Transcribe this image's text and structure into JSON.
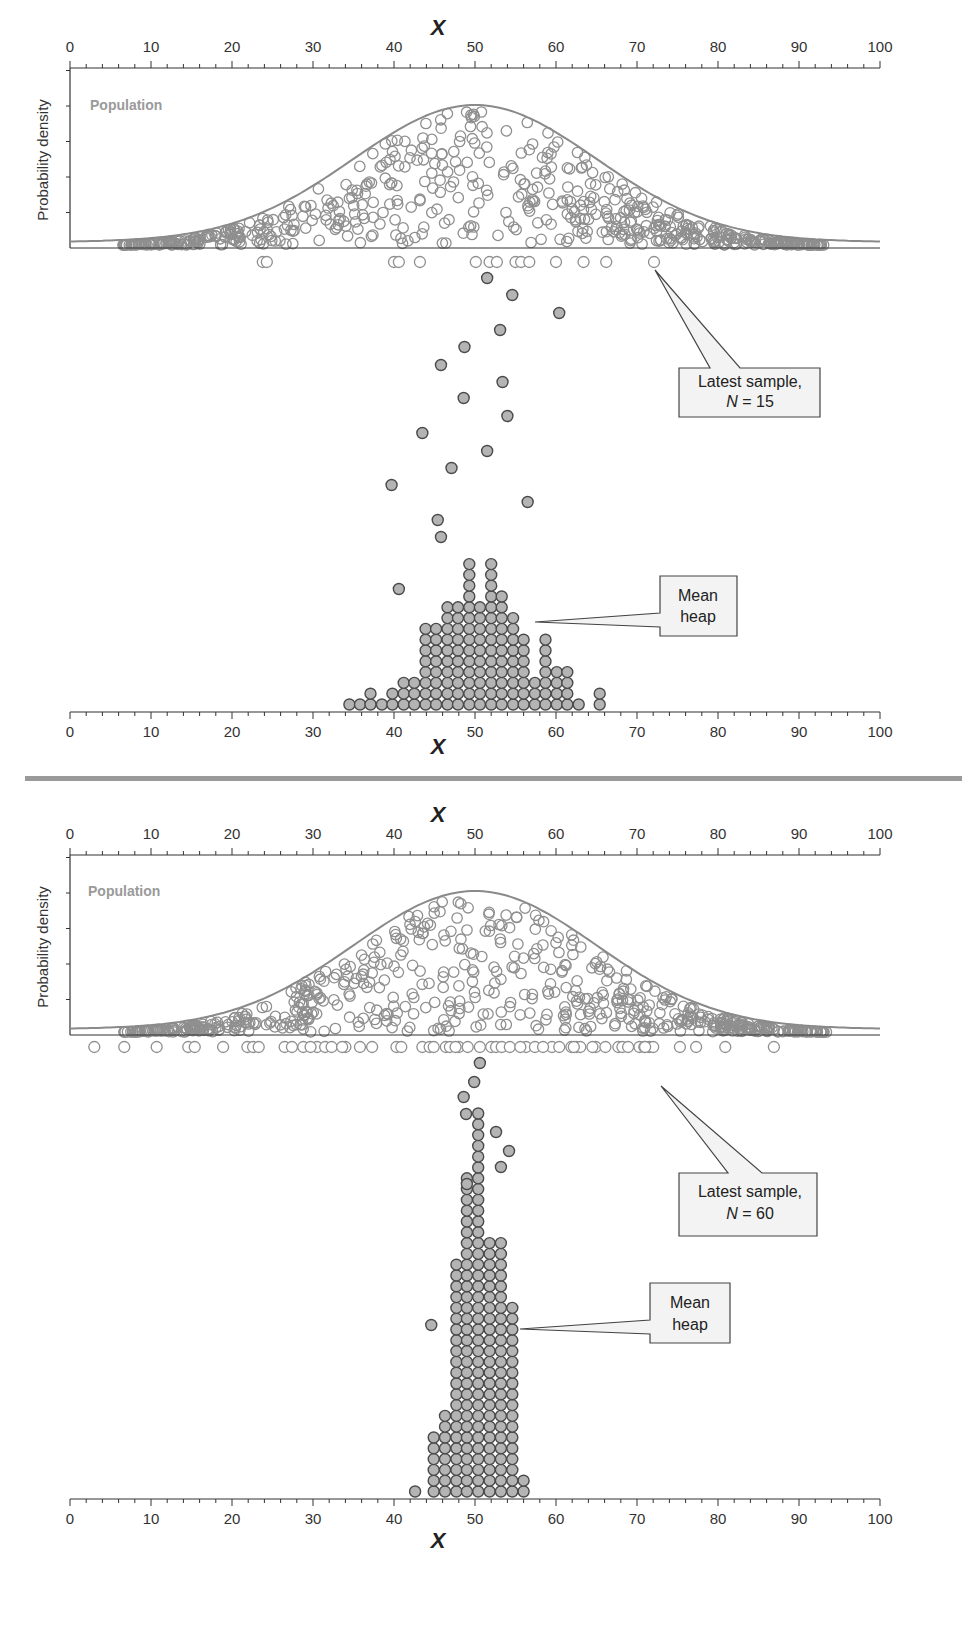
{
  "chart_data": [
    {
      "type": "scatter",
      "title": "Dance of the means: population, latest sample and mean heap",
      "xlabel": "X",
      "ylabel": "Probability density",
      "xlim": [
        0,
        100
      ],
      "x_ticks": [
        0,
        10,
        20,
        30,
        40,
        50,
        60,
        70,
        80,
        90,
        100
      ],
      "population": {
        "label": "Population",
        "distribution": "normal",
        "mean": 50,
        "sd": 15
      },
      "latest_sample": {
        "N": 15,
        "callout": [
          "Latest sample,",
          "N = 15"
        ],
        "x": [
          23.8,
          24.3,
          40.0,
          40.6,
          43.2,
          50.1,
          51.8,
          52.7,
          55.0,
          55.7,
          56.7,
          60.0,
          63.4,
          66.2,
          72.1
        ]
      },
      "falling_means": [
        {
          "x": 51.5,
          "y": 278
        },
        {
          "x": 54.6,
          "y": 295
        },
        {
          "x": 60.4,
          "y": 313
        },
        {
          "x": 53.1,
          "y": 330
        },
        {
          "x": 48.7,
          "y": 347
        },
        {
          "x": 45.8,
          "y": 365
        },
        {
          "x": 53.4,
          "y": 382
        },
        {
          "x": 48.6,
          "y": 398
        },
        {
          "x": 54.0,
          "y": 416
        },
        {
          "x": 43.5,
          "y": 433
        },
        {
          "x": 51.5,
          "y": 451
        },
        {
          "x": 47.1,
          "y": 468
        },
        {
          "x": 39.7,
          "y": 485
        },
        {
          "x": 56.5,
          "y": 502
        },
        {
          "x": 40.6,
          "y": 589
        }
      ],
      "mean_heap": {
        "callout": [
          "Mean",
          "heap"
        ],
        "columns_x": [
          34.5,
          35.8,
          37.1,
          38.5,
          39.8,
          41.2,
          42.5,
          43.9,
          45.2,
          46.6,
          47.9,
          49.3,
          50.6,
          52.0,
          53.3,
          54.7,
          56.0,
          57.4,
          58.7,
          60.1,
          61.4,
          62.8,
          65.4
        ],
        "counts": [
          1,
          1,
          2,
          1,
          2,
          3,
          3,
          8,
          8,
          10,
          10,
          14,
          10,
          14,
          11,
          9,
          7,
          3,
          7,
          4,
          4,
          1,
          2
        ],
        "extra_dots": [
          {
            "x": 45.8,
            "y": 537
          },
          {
            "x": 45.4,
            "y": 520
          }
        ]
      }
    },
    {
      "type": "scatter",
      "xlabel": "X",
      "ylabel": "Probability density",
      "xlim": [
        0,
        100
      ],
      "x_ticks": [
        0,
        10,
        20,
        30,
        40,
        50,
        60,
        70,
        80,
        90,
        100
      ],
      "population": {
        "label": "Population",
        "distribution": "normal",
        "mean": 50,
        "sd": 15
      },
      "latest_sample": {
        "N": 60,
        "callout": [
          "Latest sample,",
          "N = 60"
        ],
        "x": [
          3.0,
          6.7,
          10.7,
          14.6,
          15.4,
          21.9,
          22.6,
          23.3,
          26.5,
          27.4,
          28.8,
          30.5,
          31.5,
          32.3,
          34.0,
          35.8,
          37.3,
          40.3,
          40.9,
          43.5,
          44.4,
          46.4,
          48.0,
          49.1,
          50.6,
          52.0,
          52.6,
          53.3,
          54.3,
          56.3,
          57.4,
          59.5,
          60.4,
          61.9,
          62.5,
          63.0,
          64.9,
          66.1,
          67.7,
          68.2,
          70.3,
          70.9,
          71.5,
          72.0,
          75.3,
          77.3,
          80.9,
          86.9,
          46.9,
          47.6,
          55.6,
          58.4,
          62.2,
          68.9,
          71.0,
          64.5,
          44.9,
          33.6,
          29.7,
          18.9
        ]
      },
      "falling_means": [
        {
          "x": 50.6,
          "y": 1063
        },
        {
          "x": 49.9,
          "y": 1082
        },
        {
          "x": 48.6,
          "y": 1097
        },
        {
          "x": 48.9,
          "y": 1114
        },
        {
          "x": 52.6,
          "y": 1132
        },
        {
          "x": 54.2,
          "y": 1151
        },
        {
          "x": 53.2,
          "y": 1167
        },
        {
          "x": 44.6,
          "y": 1325
        }
      ],
      "mean_heap": {
        "callout": [
          "Mean",
          "heap"
        ],
        "columns_x": [
          42.6,
          44.9,
          46.3,
          47.7,
          49.0,
          50.4,
          51.8,
          53.2,
          54.6,
          56.0
        ],
        "counts": [
          1,
          6,
          8,
          22,
          30,
          36,
          24,
          24,
          18,
          2
        ],
        "extra_dots": [
          {
            "x": 49.0,
            "y": 1184
          }
        ]
      }
    }
  ],
  "panels": [
    {
      "x_axis_title": "X",
      "y_axis_title": "Probability density",
      "population_label": "Population",
      "sample_callout_line1": "Latest sample,",
      "sample_callout_n_symbol": "N",
      "sample_callout_n_value": "= 15",
      "heap_callout_line1": "Mean",
      "heap_callout_line2": "heap"
    },
    {
      "x_axis_title": "X",
      "y_axis_title": "Probability density",
      "population_label": "Population",
      "sample_callout_line1": "Latest sample,",
      "sample_callout_n_symbol": "N",
      "sample_callout_n_value": "= 60",
      "heap_callout_line1": "Mean",
      "heap_callout_line2": "heap"
    }
  ],
  "colors": {
    "axis": "#333333",
    "population_curve": "#8a8a8a",
    "population_points": "#8f8f8f",
    "mean_fill": "#b4b4b4",
    "mean_stroke": "#4a4a4a",
    "separator": "#9a9a9a",
    "callout_fill": "#f3f3f3"
  }
}
